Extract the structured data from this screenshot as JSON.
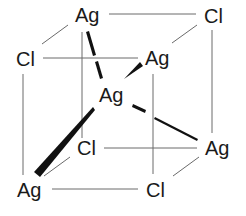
{
  "diagram": {
    "labels": {
      "ag_top_back": "Ag",
      "cl_top_back_right": "Cl",
      "cl_top_front_left": "Cl",
      "ag_top_front_right": "Ag",
      "ag_center": "Ag",
      "cl_bottom_back_left": "Cl",
      "ag_bottom_back_right": "Ag",
      "ag_bottom_front_left": "Ag",
      "cl_bottom_front_right": "Cl"
    }
  }
}
